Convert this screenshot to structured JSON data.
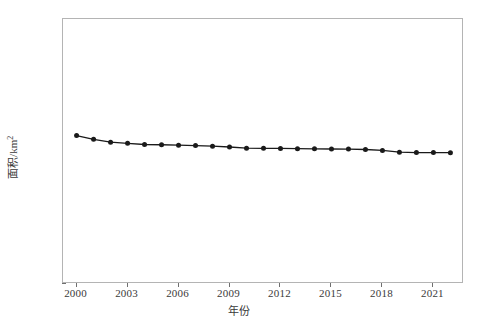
{
  "chart_data": {
    "type": "line",
    "title": "",
    "xlabel": "年份",
    "ylabel": "面积/km²",
    "ylabel_base": "面积/km",
    "ylabel_exponent": "2",
    "xlim": [
      1999.2,
      2022.8
    ],
    "ylim": [
      3500,
      5500
    ],
    "ytick_values": [
      3500,
      4000,
      4500,
      5000,
      5500
    ],
    "ytick_labels": [
      "3500",
      "4000",
      "4500",
      "5000",
      "5500"
    ],
    "xtick_values": [
      2000,
      2003,
      2006,
      2009,
      2012,
      2015,
      2018,
      2021
    ],
    "xtick_labels": [
      "2000",
      "2003",
      "2006",
      "2009",
      "2012",
      "2015",
      "2018",
      "2021"
    ],
    "grid": false,
    "legend": false,
    "marker": "filled-circle",
    "line_color": "#1a1a1a",
    "marker_color": "#1a1a1a",
    "frame_color": "#b4b4b4",
    "x": [
      2000,
      2001,
      2002,
      2003,
      2004,
      2005,
      2006,
      2007,
      2008,
      2009,
      2010,
      2011,
      2012,
      2013,
      2014,
      2015,
      2016,
      2017,
      2018,
      2019,
      2020,
      2021,
      2022
    ],
    "values": [
      4620,
      4592,
      4570,
      4562,
      4553,
      4551,
      4548,
      4545,
      4540,
      4534,
      4525,
      4524,
      4523,
      4521,
      4520,
      4519,
      4518,
      4515,
      4508,
      4495,
      4492,
      4492,
      4491
    ],
    "series": [
      {
        "name": "面积",
        "values": [
          4620,
          4592,
          4570,
          4562,
          4553,
          4551,
          4548,
          4545,
          4540,
          4534,
          4525,
          4524,
          4523,
          4521,
          4520,
          4519,
          4518,
          4515,
          4508,
          4495,
          4492,
          4492,
          4491
        ]
      }
    ]
  }
}
